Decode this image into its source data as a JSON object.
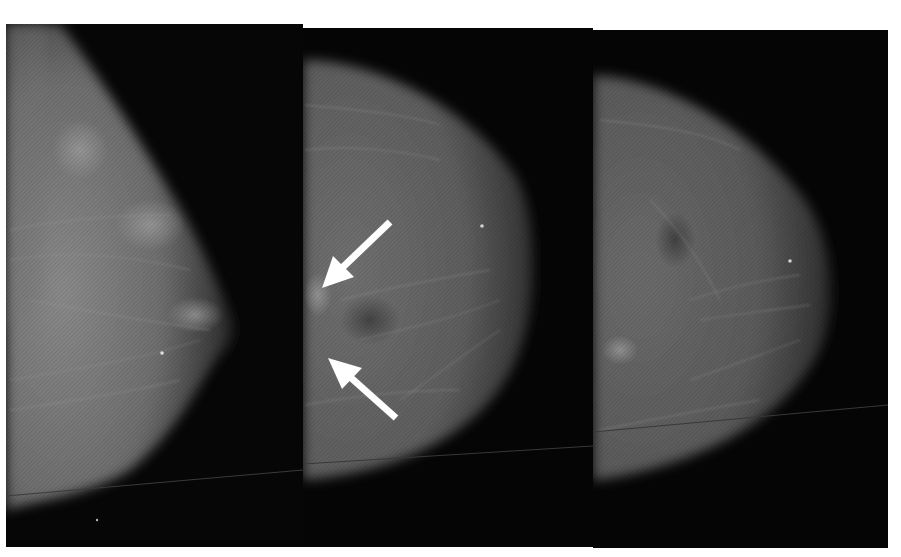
{
  "figure": {
    "type": "mammogram-triptych",
    "background": "#ffffff",
    "film_color": "#050505",
    "panels": [
      {
        "id": "panel-1",
        "view": "mediolateral oblique",
        "x": 6,
        "y": 24,
        "width": 297,
        "height": 523
      },
      {
        "id": "panel-2",
        "view": "craniocaudal",
        "x": 303,
        "y": 28,
        "width": 290,
        "height": 519,
        "annotations": 2
      },
      {
        "id": "panel-3",
        "view": "craniocaudal",
        "x": 593,
        "y": 30,
        "width": 295,
        "height": 518
      }
    ],
    "annotations": [
      {
        "type": "arrow",
        "color": "#ffffff",
        "panel": "panel-2",
        "direction": "down-left",
        "tail": [
          390,
          222
        ],
        "head": [
          322,
          288
        ]
      },
      {
        "type": "arrow",
        "color": "#ffffff",
        "panel": "panel-2",
        "direction": "up-left",
        "tail": [
          396,
          418
        ],
        "head": [
          330,
          360
        ]
      }
    ]
  }
}
